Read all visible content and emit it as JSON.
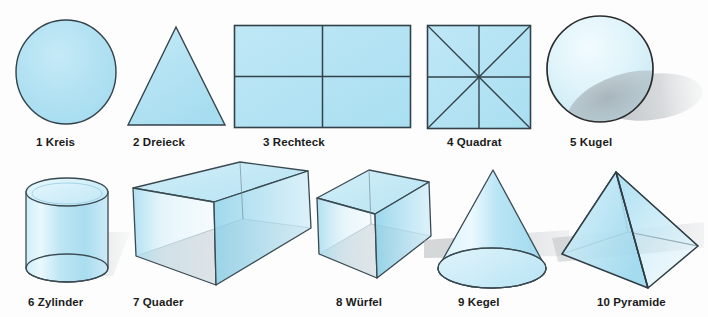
{
  "sheet": {
    "title": "Geometrische Formen und Körper",
    "background_color": "#fdfdfd",
    "width": 708,
    "height": 317
  },
  "palette": {
    "shape_fill_light": "#b3e2f2",
    "shape_fill_mid": "#9ed9ee",
    "shape_fill_pale": "#d8f0f8",
    "outline": "#2d3b42",
    "shadow_gray": "#a9adb0",
    "shadow_gray_light": "#c4c8ca",
    "label_color": "#1b1b1b"
  },
  "rows": [
    {
      "name": "flat-shapes-row",
      "shapes": [
        {
          "index": "1",
          "name": "Kreis",
          "caption": "1 Kreis",
          "kind": "circle",
          "dimension": "2D"
        },
        {
          "index": "2",
          "name": "Dreieck",
          "caption": "2 Dreieck",
          "kind": "triangle",
          "dimension": "2D"
        },
        {
          "index": "3",
          "name": "Rechteck",
          "caption": "3 Rechteck",
          "kind": "rectangle",
          "dimension": "2D"
        },
        {
          "index": "4",
          "name": "Quadrat",
          "caption": "4 Quadrat",
          "kind": "square",
          "dimension": "2D"
        },
        {
          "index": "5",
          "name": "Kugel",
          "caption": "5 Kugel",
          "kind": "sphere",
          "dimension": "3D"
        }
      ]
    },
    {
      "name": "solid-shapes-row",
      "shapes": [
        {
          "index": "6",
          "name": "Zylinder",
          "caption": "6 Zylinder",
          "kind": "cylinder",
          "dimension": "3D"
        },
        {
          "index": "7",
          "name": "Quader",
          "caption": "7 Quader",
          "kind": "cuboid",
          "dimension": "3D"
        },
        {
          "index": "8",
          "name": "Würfel",
          "caption": "8 Würfel",
          "kind": "cube",
          "dimension": "3D"
        },
        {
          "index": "9",
          "name": "Kegel",
          "caption": "9 Kegel",
          "kind": "cone",
          "dimension": "3D"
        },
        {
          "index": "10",
          "name": "Pyramide",
          "caption": "10 Pyramide",
          "kind": "pyramid",
          "dimension": "3D"
        }
      ]
    }
  ]
}
